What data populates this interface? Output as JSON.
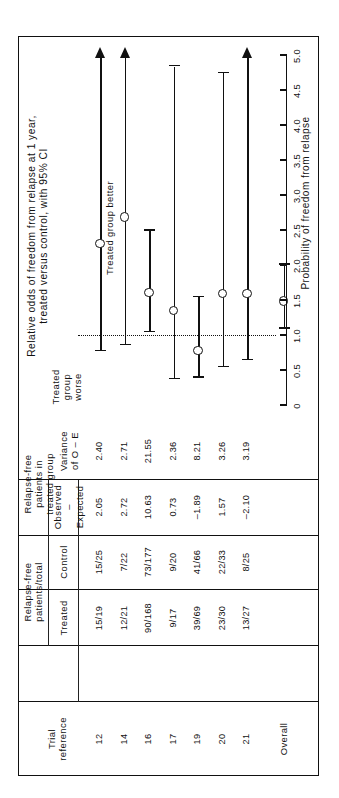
{
  "figure": {
    "plot_title": "Relative odds of freedom from relapse at 1 year,\ntreated versus control, with 95% CI",
    "axis_title": "Probability of freedom from relapse",
    "better_label": "Treated group better",
    "worse_label": "Treated\ngroup\nworse",
    "overall_label": "Overall"
  },
  "table": {
    "group_headers": [
      {
        "id": "trial",
        "label": "Trial\nreference"
      },
      {
        "id": "rf_total",
        "label": "Relapse-free\npatients/total"
      },
      {
        "id": "rf_treated",
        "label": "Relapse-free\npatients in\ntreated group"
      }
    ],
    "columns": [
      {
        "id": "trial",
        "label": "Trial\nreference"
      },
      {
        "id": "treated",
        "label": "Treated"
      },
      {
        "id": "control",
        "label": "Control"
      },
      {
        "id": "oe",
        "label": "Observed\n–\nExpected"
      },
      {
        "id": "variance",
        "label": "Variance\nof O – E"
      }
    ],
    "rows": [
      {
        "trial": "12",
        "treated": "15/19",
        "control": "15/25",
        "oe": "2.05",
        "variance": "2.40"
      },
      {
        "trial": "14",
        "treated": "12/21",
        "control": "7/22",
        "oe": "2.72",
        "variance": "2.71"
      },
      {
        "trial": "16",
        "treated": "90/168",
        "control": "73/177",
        "oe": "10.63",
        "variance": "21.55"
      },
      {
        "trial": "17",
        "treated": "9/17",
        "control": "9/20",
        "oe": "0.73",
        "variance": "2.36"
      },
      {
        "trial": "19",
        "treated": "39/69",
        "control": "41/66",
        "oe": "–1.89",
        "variance": "8.21"
      },
      {
        "trial": "20",
        "treated": "23/30",
        "control": "22/33",
        "oe": "1.57",
        "variance": "3.26"
      },
      {
        "trial": "21",
        "treated": "13/27",
        "control": "8/25",
        "oe": "–2.10",
        "variance": "3.19"
      }
    ]
  },
  "chart_data": {
    "type": "forest",
    "title": "Relative odds of freedom from relapse at 1 year, treated versus control, with 95% CI",
    "xlabel": "Probability of freedom from relapse",
    "xlim": [
      0,
      5.0
    ],
    "xticks": [
      "0",
      "0.5",
      "1.0",
      "1.5",
      "2.0",
      "2.5",
      "3.0",
      "3.5",
      "4.0",
      "4.5",
      "5.0"
    ],
    "xtick_values": [
      0,
      0.5,
      1.0,
      1.5,
      2.0,
      2.5,
      3.0,
      3.5,
      4.0,
      4.5,
      5.0
    ],
    "null_value": 1.0,
    "grid": false,
    "legend": false,
    "left_region_label": "Treated group worse",
    "right_region_label": "Treated group better",
    "points": [
      {
        "trial": "12",
        "estimate": 2.32,
        "ci_low": 0.78,
        "ci_high": 5.0,
        "ci_high_open": true,
        "marker": true
      },
      {
        "trial": "14",
        "estimate": 2.7,
        "ci_low": 0.87,
        "ci_high": 5.0,
        "ci_high_open": true,
        "marker": true
      },
      {
        "trial": "16",
        "estimate": 1.62,
        "ci_low": 1.05,
        "ci_high": 2.5,
        "ci_high_open": false,
        "marker": true
      },
      {
        "trial": "17",
        "estimate": 1.36,
        "ci_low": 0.38,
        "ci_high": 4.85,
        "ci_high_open": false,
        "marker": true
      },
      {
        "trial": "19",
        "estimate": 0.79,
        "ci_low": 0.4,
        "ci_high": 1.55,
        "ci_high_open": false,
        "marker": true
      },
      {
        "trial": "20",
        "estimate": 1.61,
        "ci_low": 0.55,
        "ci_high": 4.75,
        "ci_high_open": false,
        "marker": true
      },
      {
        "trial": "21",
        "estimate": 1.61,
        "ci_low": 0.65,
        "ci_high": 5.0,
        "ci_high_open": true,
        "marker": true
      },
      {
        "trial": "Overall",
        "estimate": 1.5,
        "ci_low": 1.1,
        "ci_high": 2.02,
        "ci_high_open": false,
        "marker": true
      }
    ]
  }
}
